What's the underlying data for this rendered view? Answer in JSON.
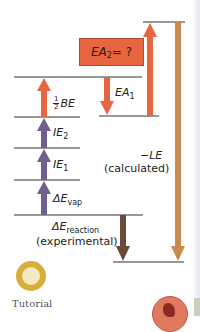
{
  "diagram": {
    "type": "Born-Haber cycle energy-level diagram",
    "colors": {
      "level_line": "#333333",
      "orange_arrow": "#e8663f",
      "purple_arrow": "#6e5f8f",
      "brown_arrow": "#6b4a3a",
      "tan_arrow": "#c98a4a",
      "ea2_box": "#e8663f"
    },
    "labels": {
      "ea2_box": "EA₂ = ?",
      "ea2_main": "EA",
      "ea2_sub": "2",
      "ea2_rest": " = ?",
      "ea1_main": "EA",
      "ea1_sub": "1",
      "half_be_num": "1",
      "half_be_den": "2",
      "half_be_main": "BE",
      "ie2_main": "IE",
      "ie2_sub": "2",
      "ie1_main": "IE",
      "ie1_sub": "1",
      "vap_delta": "ΔE",
      "vap_sub": "vap",
      "reaction_delta": "ΔE",
      "reaction_sub": "reaction",
      "reaction_note": "(experimental)",
      "le_main": "−LE",
      "le_note": "(calculated)"
    },
    "arrows": [
      {
        "name": "half-be",
        "direction": "up",
        "color": "orange"
      },
      {
        "name": "ie2",
        "direction": "up",
        "color": "purple"
      },
      {
        "name": "ie1",
        "direction": "up",
        "color": "purple"
      },
      {
        "name": "e-vap",
        "direction": "up",
        "color": "purple"
      },
      {
        "name": "ea1",
        "direction": "down",
        "color": "orange"
      },
      {
        "name": "ea2",
        "direction": "up",
        "color": "orange"
      },
      {
        "name": "e-reaction",
        "direction": "down",
        "color": "brown"
      },
      {
        "name": "minus-le",
        "direction": "down",
        "color": "tan"
      }
    ]
  },
  "footer": {
    "tutorial_label": "Tutorial"
  }
}
